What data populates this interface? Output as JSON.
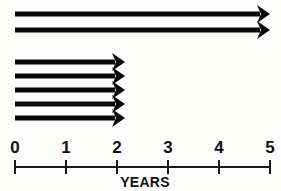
{
  "chart_data": {
    "type": "bar",
    "title": "",
    "subtitle": "",
    "xlabel": "YEARS",
    "ylabel": "",
    "xlim": [
      0,
      5
    ],
    "grid": false,
    "legend": null,
    "orientation": "horizontal",
    "marker": "arrowhead-right",
    "axis": {
      "ticks": [
        0,
        1,
        2,
        3,
        4,
        5
      ],
      "tick_labels": [
        "0",
        "1",
        "2",
        "3",
        "4",
        "5"
      ],
      "label": "YEARS",
      "line_color": "#1a1a1a"
    },
    "arrow_color": "#090909",
    "background_color": "#fdfdfc",
    "groups": [
      {
        "name": "long-arrows",
        "count": 2,
        "bars": [
          {
            "id": 1,
            "start": 0,
            "end": 5,
            "extends_beyond_axis": true,
            "thickness": 5
          },
          {
            "id": 2,
            "start": 0,
            "end": 5,
            "extends_beyond_axis": true,
            "thickness": 5
          }
        ]
      },
      {
        "name": "short-arrows",
        "count": 5,
        "bars": [
          {
            "id": 3,
            "start": 0,
            "end": 2,
            "extends_beyond_axis": false,
            "thickness": 5
          },
          {
            "id": 4,
            "start": 0,
            "end": 2,
            "extends_beyond_axis": false,
            "thickness": 5
          },
          {
            "id": 5,
            "start": 0,
            "end": 2,
            "extends_beyond_axis": false,
            "thickness": 5
          },
          {
            "id": 6,
            "start": 0,
            "end": 2,
            "extends_beyond_axis": false,
            "thickness": 5
          },
          {
            "id": 7,
            "start": 0,
            "end": 2,
            "extends_beyond_axis": false,
            "thickness": 5
          }
        ]
      }
    ],
    "categories": [
      "bar-1",
      "bar-2",
      "bar-3",
      "bar-4",
      "bar-5",
      "bar-6",
      "bar-7"
    ],
    "values": [
      5,
      5,
      2,
      2,
      2,
      2,
      2
    ]
  },
  "geometry": {
    "axis_y": 167,
    "x_origin": 15,
    "px_per_year": 51,
    "tick_half_height": 7,
    "bar_rows_top": [
      14,
      30
    ],
    "bar_rows_bottom": [
      62,
      76,
      90,
      104,
      118
    ],
    "bar_thickness": 5,
    "head_length": 13,
    "head_half_width": 9,
    "head_notch": 4,
    "long_arrow_tip_x": 270,
    "short_arrow_tip_x": 125,
    "years_label_x": 145,
    "years_label_y": 187,
    "tick_label_y": 153
  }
}
